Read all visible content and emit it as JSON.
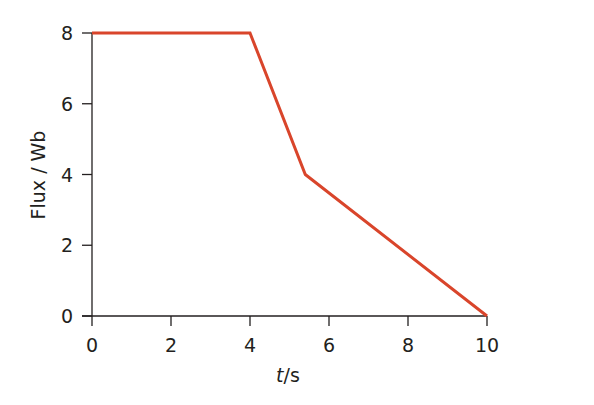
{
  "chart_data": {
    "type": "line",
    "title": "",
    "xlabel": "t/s",
    "xlabel_italic_part": "t",
    "xlabel_rest": "/s",
    "ylabel": "Flux / Wb",
    "xlim": [
      0,
      10
    ],
    "ylim": [
      0,
      8
    ],
    "xticks": [
      0,
      2,
      4,
      6,
      8,
      10
    ],
    "yticks": [
      0,
      2,
      4,
      6,
      8
    ],
    "grid": false,
    "legend": null,
    "series": [
      {
        "name": "Flux",
        "color": "#d9452b",
        "x": [
          0,
          4,
          5.4,
          10
        ],
        "y": [
          8,
          8,
          4,
          0
        ]
      }
    ]
  },
  "colors": {
    "line": "#d9452b",
    "axis": "#231f20"
  }
}
